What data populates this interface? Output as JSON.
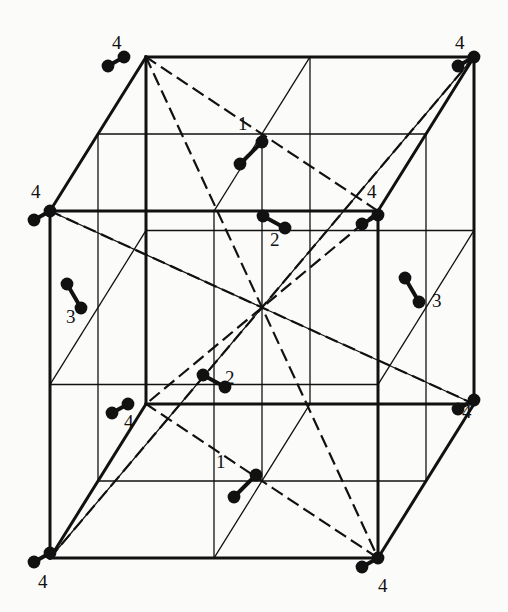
{
  "figure": {
    "kind": "crystal-unit-cell-diagram",
    "background_color": "#fbfbf9",
    "line_color": "#111111",
    "atom_color": "#111111"
  },
  "projection": {
    "front_left": 50,
    "front_top": 211,
    "front_right": 378,
    "front_bottom": 558,
    "depth_dx": 96,
    "depth_dy": -154,
    "subdivisions": 2
  },
  "styles": {
    "outer_edge_width": 3.0,
    "inner_edge_width": 1.3,
    "dashed_width": 2.2,
    "dash_pattern": "11,8",
    "atom_radius": 6.4,
    "bond_width": 4.0
  },
  "corner_labels": [
    {
      "text": "4",
      "x": 112,
      "y": 33
    },
    {
      "text": "4",
      "x": 455,
      "y": 33
    },
    {
      "text": "4",
      "x": 31,
      "y": 182
    },
    {
      "text": "4",
      "x": 367,
      "y": 182
    },
    {
      "text": "4",
      "x": 124,
      "y": 412
    },
    {
      "text": "4",
      "x": 462,
      "y": 402
    },
    {
      "text": "4",
      "x": 38,
      "y": 572
    },
    {
      "text": "4",
      "x": 378,
      "y": 576
    }
  ],
  "site_labels": [
    {
      "text": "1",
      "x": 238,
      "y": 114
    },
    {
      "text": "2",
      "x": 270,
      "y": 230
    },
    {
      "text": "3",
      "x": 66,
      "y": 307
    },
    {
      "text": "3",
      "x": 432,
      "y": 291
    },
    {
      "text": "2",
      "x": 225,
      "y": 368
    },
    {
      "text": "1",
      "x": 216,
      "y": 452
    }
  ],
  "corner_atoms": [
    {
      "name": "back-top-left",
      "x": 124,
      "y": 57,
      "pair_dx": -16,
      "pair_dy": 9
    },
    {
      "name": "back-top-right",
      "x": 474,
      "y": 57,
      "pair_dx": -16,
      "pair_dy": 9
    },
    {
      "name": "front-top-left",
      "x": 50,
      "y": 211,
      "pair_dx": -16,
      "pair_dy": 9
    },
    {
      "name": "front-top-right",
      "x": 378,
      "y": 215,
      "pair_dx": -16,
      "pair_dy": 9
    },
    {
      "name": "mid-left-upper",
      "x": 128,
      "y": 404,
      "pair_dx": -16,
      "pair_dy": 9
    },
    {
      "name": "back-bottom-right",
      "x": 474,
      "y": 400,
      "pair_dx": -16,
      "pair_dy": 9
    },
    {
      "name": "front-bottom-left",
      "x": 50,
      "y": 553,
      "pair_dx": -16,
      "pair_dy": 9
    },
    {
      "name": "front-bottom-right",
      "x": 378,
      "y": 558,
      "pair_dx": -16,
      "pair_dy": 9
    }
  ],
  "dumbbells": [
    {
      "label": "1",
      "x": 262,
      "y": 142,
      "dx": -22,
      "dy": 22
    },
    {
      "label": "2",
      "x": 285,
      "y": 228,
      "dx": -22,
      "dy": -12
    },
    {
      "label": "3",
      "x": 81,
      "y": 308,
      "dx": -14,
      "dy": -24
    },
    {
      "label": "3",
      "x": 419,
      "y": 302,
      "dx": -14,
      "dy": -24
    },
    {
      "label": "2",
      "x": 225,
      "y": 387,
      "dx": -22,
      "dy": -12
    },
    {
      "label": "1",
      "x": 256,
      "y": 475,
      "dx": -22,
      "dy": 22
    }
  ],
  "legend_note": {
    "site_numbers": [
      "1",
      "2",
      "3",
      "4"
    ],
    "meaning": "numbered inequivalent molecular orientation sites"
  }
}
